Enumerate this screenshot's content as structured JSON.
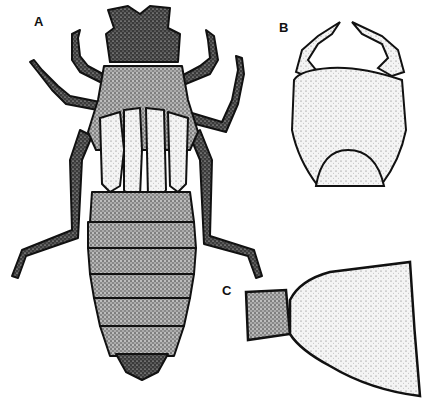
{
  "figure": {
    "panels": [
      {
        "id": "A",
        "label": "A",
        "subject": "larva-dorsal-view"
      },
      {
        "id": "B",
        "label": "B",
        "subject": "labium-mask"
      },
      {
        "id": "C",
        "label": "C",
        "subject": "gill-lamella"
      }
    ],
    "colors": {
      "ink": "#111111",
      "stipple_dark": "#2a2a2a",
      "stipple_light": "#e8e8e8",
      "background": "#ffffff"
    }
  }
}
